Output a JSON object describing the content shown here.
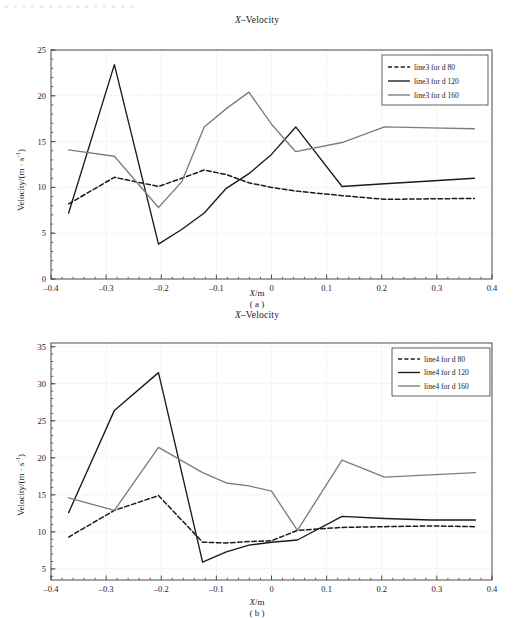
{
  "header_text": "▫ ▫ ▫ ▫ ▫ ▫ ▫ ▫ ▫ ▫ ▫ ▫ ▫ ▫ ▫",
  "axis_label_y": "Velocity/(m · s",
  "axis_label_y_sup": "-1",
  "axis_label_y_tail": ")",
  "axis_label_x_prefix": "X",
  "axis_label_x_suffix": "/m",
  "colors": {
    "d80": "#1a1a1a",
    "d120": "#1a1a1a",
    "d160": "#7d7d7d",
    "grid": "#d9d9e0",
    "axis": "#3a3a3a",
    "background": "#ffffff"
  },
  "figures": [
    {
      "id": "a",
      "caption": "( a )",
      "title_prefix": "X",
      "title_suffix": "–Velocity"
    },
    {
      "id": "b",
      "caption": "( b )",
      "title_prefix": "X",
      "title_suffix": "–Velocity"
    }
  ],
  "chart_data": [
    {
      "type": "line",
      "id": "a",
      "title": "X–Velocity",
      "caption": "( a )",
      "xlabel": "X/m",
      "ylabel": "Velocity/(m · s⁻¹)",
      "xlim": [
        -0.4,
        0.4
      ],
      "ylim": [
        0,
        25
      ],
      "xticks": [
        -0.4,
        -0.3,
        -0.2,
        -0.1,
        0,
        0.1,
        0.2,
        0.3,
        0.4
      ],
      "xticklabels": [
        "-0.4",
        "-0.3",
        "-0.2",
        "-0.1",
        "0",
        "0.1",
        "0.2",
        "0.3",
        "0.4"
      ],
      "yticks": [
        0,
        5,
        10,
        15,
        20,
        25
      ],
      "yticklabels": [
        "0",
        "5",
        "10",
        "15",
        "20",
        "25"
      ],
      "grid": true,
      "minor_ticks": true,
      "legend_position": "upper right",
      "series": [
        {
          "name": "line3 for d 80",
          "style": "dashed",
          "color": "#1a1a1a",
          "x": [
            -0.368,
            -0.285,
            -0.205,
            -0.163,
            -0.122,
            -0.082,
            -0.041,
            0.0,
            0.044,
            0.128,
            0.205,
            0.288,
            0.368
          ],
          "y": [
            8.2,
            11.1,
            10.1,
            11.0,
            11.9,
            11.4,
            10.5,
            10.0,
            9.6,
            9.1,
            8.7,
            8.75,
            8.8
          ]
        },
        {
          "name": "line3 for d 120",
          "style": "solid",
          "color": "#1a1a1a",
          "x": [
            -0.368,
            -0.285,
            -0.205,
            -0.163,
            -0.122,
            -0.082,
            -0.041,
            0.0,
            0.044,
            0.128,
            0.205,
            0.288,
            0.368
          ],
          "y": [
            7.2,
            23.4,
            3.8,
            5.4,
            7.2,
            9.9,
            11.5,
            13.6,
            16.6,
            10.1,
            10.4,
            10.7,
            11.0
          ]
        },
        {
          "name": "line3 for d 160",
          "style": "solid",
          "color": "#7d7d7d",
          "x": [
            -0.368,
            -0.285,
            -0.205,
            -0.163,
            -0.122,
            -0.082,
            -0.041,
            0.0,
            0.044,
            0.128,
            0.205,
            0.288,
            0.368
          ],
          "y": [
            14.1,
            13.4,
            7.8,
            10.6,
            16.6,
            18.6,
            20.4,
            16.9,
            13.9,
            14.9,
            16.6,
            16.5,
            16.4
          ]
        }
      ]
    },
    {
      "type": "line",
      "id": "b",
      "title": "X–Velocity",
      "caption": "( b )",
      "xlabel": "X/m",
      "ylabel": "Velocity/(m · s⁻¹)",
      "xlim": [
        -0.4,
        0.4
      ],
      "ylim": [
        3.5,
        35.5
      ],
      "xticks": [
        -0.4,
        -0.3,
        -0.2,
        -0.1,
        0,
        0.1,
        0.2,
        0.3,
        0.4
      ],
      "xticklabels": [
        "-0.4",
        "-0.3",
        "-0.2",
        "-0.1",
        "0",
        "0.1",
        "0.2",
        "0.3",
        "0.4"
      ],
      "yticks": [
        5,
        10,
        15,
        20,
        25,
        30,
        35
      ],
      "yticklabels": [
        "5",
        "10",
        "15",
        "20",
        "25",
        "30",
        "35"
      ],
      "grid": true,
      "minor_ticks": true,
      "legend_position": "upper right",
      "series": [
        {
          "name": "line4 for d 80",
          "style": "dashed",
          "color": "#1a1a1a",
          "x": [
            -0.368,
            -0.285,
            -0.205,
            -0.125,
            -0.082,
            -0.041,
            0.0,
            0.047,
            0.128,
            0.205,
            0.288,
            0.37
          ],
          "y": [
            9.3,
            12.9,
            14.9,
            8.6,
            8.5,
            8.7,
            8.8,
            10.2,
            10.6,
            10.7,
            10.8,
            10.7
          ]
        },
        {
          "name": "line4 for d 120",
          "style": "solid",
          "color": "#1a1a1a",
          "x": [
            -0.368,
            -0.285,
            -0.205,
            -0.125,
            -0.082,
            -0.041,
            0.0,
            0.047,
            0.128,
            0.205,
            0.288,
            0.37
          ],
          "y": [
            12.6,
            26.4,
            31.5,
            5.9,
            7.3,
            8.2,
            8.6,
            8.9,
            12.1,
            11.8,
            11.6,
            11.6
          ]
        },
        {
          "name": "line4 for d 160",
          "style": "solid",
          "color": "#7d7d7d",
          "x": [
            -0.368,
            -0.285,
            -0.205,
            -0.125,
            -0.082,
            -0.041,
            0.0,
            0.047,
            0.128,
            0.205,
            0.288,
            0.37
          ],
          "y": [
            14.6,
            12.9,
            21.4,
            18.0,
            16.6,
            16.2,
            15.5,
            10.2,
            19.7,
            17.4,
            17.7,
            18.0
          ]
        }
      ]
    }
  ]
}
